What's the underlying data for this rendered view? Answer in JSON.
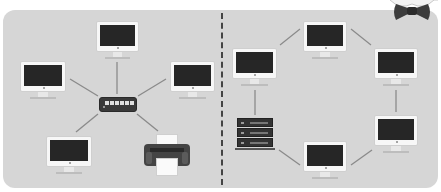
{
  "diagram": {
    "type": "network-topology-comparison",
    "panels": [
      {
        "name": "star-topology",
        "hub": "switch",
        "nodes": [
          "monitor-top",
          "monitor-left",
          "monitor-right",
          "monitor-bottom-left",
          "printer"
        ]
      },
      {
        "name": "ring-topology",
        "nodes": [
          "monitor-top",
          "monitor-right",
          "monitor-right-bottom",
          "monitor-bottom",
          "server",
          "monitor-left"
        ]
      }
    ],
    "colors": {
      "panel_background": "#d6d6d6",
      "link": "#8a8a8a",
      "screen": "#262626",
      "device_dark": "#3a3a3a",
      "divider": "#444444"
    },
    "icons": {
      "monitor": "monitor-icon",
      "switch": "network-switch-icon",
      "printer": "printer-icon",
      "server": "server-rack-icon",
      "mascot": "bow-tie-icon"
    }
  }
}
